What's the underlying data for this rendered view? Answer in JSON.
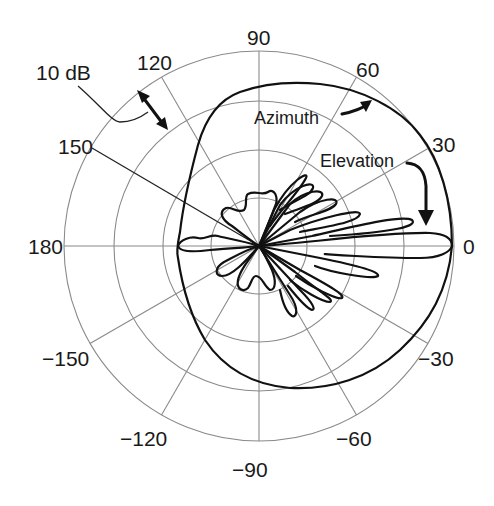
{
  "diagram": {
    "type": "polar-radiation-pattern",
    "angle_labels": [
      {
        "text": "0",
        "angle": 0
      },
      {
        "text": "30",
        "angle": 30
      },
      {
        "text": "60",
        "angle": 60
      },
      {
        "text": "90",
        "angle": 90
      },
      {
        "text": "120",
        "angle": 120
      },
      {
        "text": "150",
        "angle": 150
      },
      {
        "text": "180",
        "angle": 180
      },
      {
        "text": "−150",
        "angle": -150
      },
      {
        "text": "−120",
        "angle": -120
      },
      {
        "text": "−90",
        "angle": -90
      },
      {
        "text": "−60",
        "angle": -60
      },
      {
        "text": "−30",
        "angle": -30
      }
    ],
    "scale_annotation": "10 dB",
    "rings": 4,
    "ring_step_db": 10,
    "curves": [
      {
        "name": "Azimuth",
        "label": "Azimuth",
        "description": "broad near-omnidirectional pattern, slightly wider toward 0 deg"
      },
      {
        "name": "Elevation",
        "label": "Elevation",
        "description": "narrow main lobe along 0 deg with many side lobes"
      }
    ],
    "colors": {
      "grid": "#8a8a8a",
      "curve": "#111111",
      "text": "#1a1a1a",
      "background": "#ffffff"
    }
  },
  "labels": {
    "a0": "0",
    "a30": "30",
    "a60": "60",
    "a90": "90",
    "a120": "120",
    "a150": "150",
    "a180": "180",
    "am150": "−150",
    "am120": "−120",
    "am90": "−90",
    "am60": "−60",
    "am30": "−30",
    "scale": "10 dB",
    "azimuth": "Azimuth",
    "elevation": "Elevation"
  }
}
